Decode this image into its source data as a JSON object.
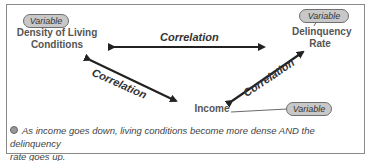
{
  "nodes": {
    "density": {
      "tag": "Variable",
      "label_line1": "Density of Living",
      "label_line2": "Conditions"
    },
    "delinquency": {
      "tag": "Variable",
      "label_line1": "Delinquency",
      "label_line2": "Rate"
    },
    "income": {
      "tag": "Variable",
      "label": "Income"
    }
  },
  "edges": {
    "top": "Correlation",
    "left": "Correlation",
    "right": "Correlation"
  },
  "note": {
    "line1": "As income goes down, living conditions become more dense AND the delinquency",
    "line2": "rate goes up."
  },
  "colors": {
    "pill_fill": "#c8c8c8",
    "arrow": "#222222",
    "border": "#8a8a8a"
  }
}
